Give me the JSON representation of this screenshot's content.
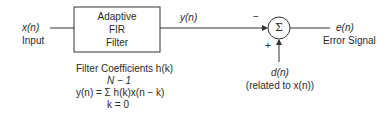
{
  "diagram": {
    "input": {
      "signal": "x(n)",
      "label": "Input"
    },
    "filter_block": {
      "line1": "Adaptive",
      "line2": "FIR",
      "line3": "Filter"
    },
    "filter_output": {
      "signal": "y(n)"
    },
    "summer": {
      "symbol": "Σ",
      "minus_sign": "−",
      "plus_sign": "+"
    },
    "output": {
      "signal": "e(n)",
      "label": "Error Signal"
    },
    "desired": {
      "signal": "d(n)",
      "note": "(related to x(n))"
    },
    "equation": {
      "title": "Filter Coefficients h(k)",
      "upper_limit": "N − 1",
      "formula": "y(n) = Σ h(k)x(n − k)",
      "lower_limit": "k = 0"
    }
  }
}
